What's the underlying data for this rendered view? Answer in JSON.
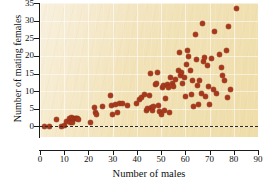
{
  "chart_data": {
    "type": "scatter",
    "title": "",
    "xlabel": "Number of males",
    "ylabel": "Number of mating females",
    "xlim": [
      0,
      90
    ],
    "ylim": [
      -3,
      35
    ],
    "xticks": [
      0,
      10,
      20,
      30,
      40,
      50,
      60,
      70,
      80,
      90
    ],
    "yticks": [
      0,
      5,
      10,
      15,
      20,
      25,
      30,
      35
    ],
    "grid": true,
    "legend": null,
    "marker_color": "#a8381c",
    "panel_color": "#f1e1b4",
    "reference_line": {
      "axis": "y",
      "value": 0,
      "style": "dashed",
      "color": "#2b2b2b"
    },
    "points": [
      [
        2,
        0
      ],
      [
        4,
        0
      ],
      [
        7,
        2
      ],
      [
        9,
        0
      ],
      [
        10,
        0.3
      ],
      [
        11,
        1.5
      ],
      [
        12,
        2.2
      ],
      [
        12.5,
        1.2
      ],
      [
        13,
        2.4
      ],
      [
        13.5,
        1.0
      ],
      [
        14,
        2.3
      ],
      [
        14.5,
        2.3
      ],
      [
        15,
        2.2
      ],
      [
        15.5,
        2.2
      ],
      [
        16,
        2.1
      ],
      [
        21,
        1.0
      ],
      [
        22.5,
        5.3
      ],
      [
        23,
        4.0
      ],
      [
        23.5,
        3.3
      ],
      [
        26,
        5.7
      ],
      [
        29,
        8.8
      ],
      [
        29.5,
        5.8
      ],
      [
        30,
        3.3
      ],
      [
        31,
        6.2
      ],
      [
        32,
        3.9
      ],
      [
        33,
        6.5
      ],
      [
        34,
        6.5
      ],
      [
        36,
        5.8
      ],
      [
        40,
        6.6
      ],
      [
        41,
        7.6
      ],
      [
        42,
        8.2
      ],
      [
        43,
        9.0
      ],
      [
        44,
        4.4
      ],
      [
        44.5,
        5.0
      ],
      [
        45,
        8.8
      ],
      [
        45.5,
        15.1
      ],
      [
        46,
        5.5
      ],
      [
        46.5,
        4.4
      ],
      [
        47,
        5.7
      ],
      [
        47.5,
        11.9
      ],
      [
        48,
        12.2
      ],
      [
        48.5,
        15.2
      ],
      [
        49,
        5.8
      ],
      [
        49.5,
        4.1
      ],
      [
        50,
        3.3
      ],
      [
        50.5,
        10.9
      ],
      [
        51,
        11.6
      ],
      [
        51.5,
        4.5
      ],
      [
        52,
        7.8
      ],
      [
        52.5,
        12.0
      ],
      [
        53,
        11.1
      ],
      [
        53.5,
        4.0
      ],
      [
        54,
        13.9
      ],
      [
        54.5,
        12.1
      ],
      [
        55,
        11.2
      ],
      [
        56,
        13.2
      ],
      [
        57,
        16.0
      ],
      [
        57.5,
        21.1
      ],
      [
        58,
        14.5
      ],
      [
        58.5,
        15.3
      ],
      [
        59,
        12.2
      ],
      [
        59.5,
        14.0
      ],
      [
        60,
        8.6
      ],
      [
        60.5,
        17.7
      ],
      [
        61,
        21.4
      ],
      [
        61.5,
        19.8
      ],
      [
        62,
        16.0
      ],
      [
        62.5,
        9.0
      ],
      [
        63,
        12.9
      ],
      [
        63.5,
        5.7
      ],
      [
        64,
        26.0
      ],
      [
        64.5,
        19.1
      ],
      [
        65,
        11.5
      ],
      [
        65.5,
        6.3
      ],
      [
        66,
        13.0
      ],
      [
        66.5,
        9.3
      ],
      [
        67,
        29.1
      ],
      [
        67.5,
        18.4
      ],
      [
        68,
        19.5
      ],
      [
        68.5,
        8.5
      ],
      [
        69,
        17.4
      ],
      [
        69.5,
        11.4
      ],
      [
        70,
        6.1
      ],
      [
        71,
        19.4
      ],
      [
        71.5,
        10.6
      ],
      [
        72,
        27.0
      ],
      [
        73,
        9.4
      ],
      [
        74,
        20.3
      ],
      [
        75,
        16.6
      ],
      [
        75.5,
        14.5
      ],
      [
        76,
        12.9
      ],
      [
        77,
        21.5
      ],
      [
        77.5,
        8.2
      ],
      [
        78,
        28.4
      ],
      [
        78.5,
        10.4
      ],
      [
        81,
        33.3
      ]
    ]
  }
}
